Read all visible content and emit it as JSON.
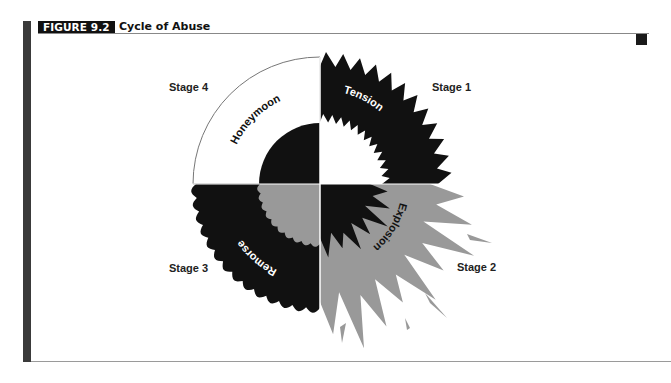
{
  "figure": {
    "label": "FIGURE 9.2",
    "title": "Cycle of Abuse"
  },
  "diagram": {
    "center": [
      320,
      184
    ],
    "colors": {
      "dark": "#111111",
      "gray": "#999999",
      "white": "#ffffff"
    },
    "stages": [
      {
        "stage_label": "Stage 1",
        "phase": "Tension",
        "quadrant": "top-right",
        "fill": "#111111",
        "inner_fill": "#ffffff"
      },
      {
        "stage_label": "Stage 2",
        "phase": "Explosion",
        "quadrant": "bottom-right",
        "fill": "#999999",
        "inner_fill": "#111111"
      },
      {
        "stage_label": "Stage 3",
        "phase": "Remorse",
        "quadrant": "bottom-left",
        "fill": "#111111",
        "inner_fill": "#999999"
      },
      {
        "stage_label": "Stage 4",
        "phase": "Honeymoon",
        "quadrant": "top-left",
        "fill": "#ffffff",
        "inner_fill": "#111111"
      }
    ]
  }
}
